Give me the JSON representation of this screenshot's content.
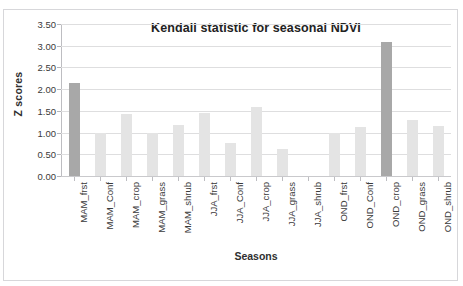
{
  "top_clipped_text": "",
  "chart_data": {
    "type": "bar",
    "title": "Kendall statistic for seasonal NDVI",
    "xlabel": "Seasons",
    "ylabel": "Z scores",
    "ylim": [
      0.0,
      3.5
    ],
    "ytick_labels": [
      "3.50",
      "3.00",
      "2.50",
      "2.00",
      "1.50",
      "1.00",
      "0.50",
      "0.00"
    ],
    "ytick_values": [
      3.5,
      3.0,
      2.5,
      2.0,
      1.5,
      1.0,
      0.5,
      0.0
    ],
    "grid": true,
    "legend": false,
    "bar_color": "#e4e4e4",
    "accent_bar_color": "#a8a8a8",
    "categories": [
      "MAM_frst",
      "MAM_Conf",
      "MAM_crop",
      "MAM_grass",
      "MAM_shrub",
      "JJA_frst",
      "JJA_Conf",
      "JJA_crop",
      "JJA_grass",
      "JJA_shrub",
      "OND_frst",
      "OND_Conf",
      "OND_crop",
      "OND_grass",
      "OND_shrub"
    ],
    "values": [
      2.14,
      1.0,
      1.43,
      1.0,
      1.18,
      1.45,
      0.77,
      1.58,
      0.62,
      0.0,
      1.0,
      1.14,
      3.08,
      1.3,
      1.15
    ],
    "highlighted": [
      0,
      12
    ]
  }
}
